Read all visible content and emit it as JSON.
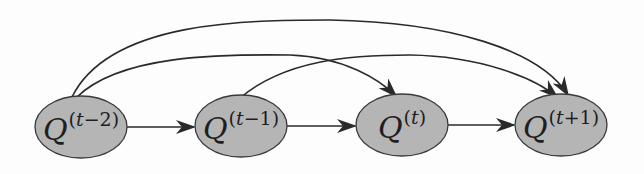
{
  "diagram": {
    "type": "directed-graph",
    "colors": {
      "node_fill": "#b5b5b5",
      "node_stroke": "#3a3a3a",
      "edge_stroke": "#2a2a2a",
      "background": "#fdfdfd"
    },
    "nodes": [
      {
        "id": "q_t_minus_2",
        "symbol": "Q",
        "sup_pre": "(",
        "sup_var": "t",
        "sup_post": "−2)",
        "cx": 81,
        "cy": 127
      },
      {
        "id": "q_t_minus_1",
        "symbol": "Q",
        "sup_pre": "(",
        "sup_var": "t",
        "sup_post": "−1)",
        "cx": 241,
        "cy": 126
      },
      {
        "id": "q_t",
        "symbol": "Q",
        "sup_pre": "(",
        "sup_var": "t",
        "sup_post": ")",
        "cx": 402,
        "cy": 125
      },
      {
        "id": "q_t_plus_1",
        "symbol": "Q",
        "sup_pre": "(",
        "sup_var": "t",
        "sup_post": "+1)",
        "cx": 561,
        "cy": 125
      }
    ],
    "edges": [
      {
        "from": "q_t_minus_2",
        "to": "q_t_minus_1",
        "kind": "straight"
      },
      {
        "from": "q_t_minus_1",
        "to": "q_t",
        "kind": "straight"
      },
      {
        "from": "q_t",
        "to": "q_t_plus_1",
        "kind": "straight"
      },
      {
        "from": "q_t_minus_2",
        "to": "q_t",
        "kind": "arc"
      },
      {
        "from": "q_t_minus_1",
        "to": "q_t_plus_1",
        "kind": "arc"
      },
      {
        "from": "q_t_minus_2",
        "to": "q_t_plus_1",
        "kind": "arc-outer"
      }
    ]
  }
}
